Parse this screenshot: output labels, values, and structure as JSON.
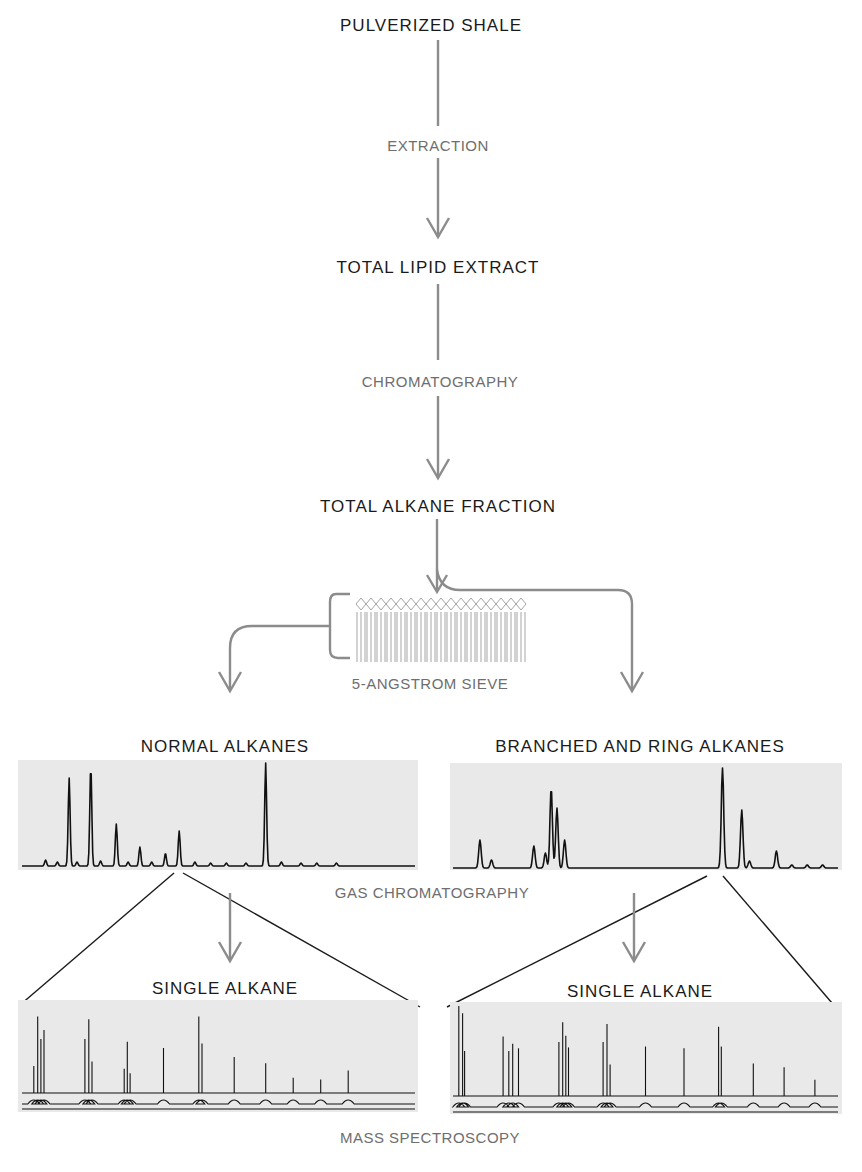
{
  "nodes": {
    "pulverized_shale": "PULVERIZED SHALE",
    "total_lipid_extract": "TOTAL LIPID EXTRACT",
    "total_alkane_fraction": "TOTAL ALKANE FRACTION",
    "normal_alkanes": "NORMAL ALKANES",
    "branched_ring_alkanes": "BRANCHED AND RING ALKANES",
    "single_alkane_left": "SINGLE ALKANE",
    "single_alkane_right": "SINGLE ALKANE"
  },
  "steps": {
    "extraction": "EXTRACTION",
    "chromatography": "CHROMATOGRAPHY",
    "sieve": "5-ANGSTROM SIEVE",
    "gas_chromatography": "GAS CHROMATOGRAPHY",
    "mass_spectroscopy": "MASS SPECTROSCOPY"
  },
  "traces": {
    "normal_gc_peaks": [
      [
        0.06,
        0.06
      ],
      [
        0.09,
        0.04
      ],
      [
        0.12,
        0.88
      ],
      [
        0.14,
        0.04
      ],
      [
        0.175,
        1.0
      ],
      [
        0.2,
        0.05
      ],
      [
        0.24,
        0.42
      ],
      [
        0.27,
        0.04
      ],
      [
        0.3,
        0.19
      ],
      [
        0.33,
        0.04
      ],
      [
        0.365,
        0.13
      ],
      [
        0.4,
        0.35
      ],
      [
        0.44,
        0.04
      ],
      [
        0.48,
        0.03
      ],
      [
        0.52,
        0.03
      ],
      [
        0.57,
        0.03
      ],
      [
        0.62,
        1.03
      ],
      [
        0.66,
        0.04
      ],
      [
        0.71,
        0.03
      ],
      [
        0.75,
        0.03
      ],
      [
        0.8,
        0.03
      ]
    ],
    "branched_gc_peaks": [
      [
        0.07,
        0.28
      ],
      [
        0.1,
        0.08
      ],
      [
        0.21,
        0.22
      ],
      [
        0.24,
        0.15
      ],
      [
        0.255,
        0.8
      ],
      [
        0.27,
        0.6
      ],
      [
        0.29,
        0.28
      ],
      [
        0.7,
        1.0
      ],
      [
        0.75,
        0.58
      ],
      [
        0.77,
        0.07
      ],
      [
        0.84,
        0.17
      ],
      [
        0.88,
        0.03
      ],
      [
        0.92,
        0.03
      ],
      [
        0.96,
        0.03
      ]
    ],
    "ms_left_peaks": [
      [
        0.03,
        0.3
      ],
      [
        0.04,
        0.85
      ],
      [
        0.048,
        0.6
      ],
      [
        0.056,
        0.7
      ],
      [
        0.16,
        0.6
      ],
      [
        0.17,
        0.82
      ],
      [
        0.178,
        0.35
      ],
      [
        0.26,
        0.27
      ],
      [
        0.268,
        0.57
      ],
      [
        0.275,
        0.22
      ],
      [
        0.36,
        0.5
      ],
      [
        0.45,
        0.85
      ],
      [
        0.458,
        0.55
      ],
      [
        0.54,
        0.4
      ],
      [
        0.62,
        0.33
      ],
      [
        0.69,
        0.17
      ],
      [
        0.76,
        0.15
      ],
      [
        0.83,
        0.25
      ]
    ],
    "ms_right_peaks": [
      [
        0.015,
        1.0
      ],
      [
        0.025,
        0.92
      ],
      [
        0.03,
        0.5
      ],
      [
        0.13,
        0.66
      ],
      [
        0.145,
        0.5
      ],
      [
        0.155,
        0.58
      ],
      [
        0.17,
        0.53
      ],
      [
        0.275,
        0.6
      ],
      [
        0.285,
        0.82
      ],
      [
        0.293,
        0.67
      ],
      [
        0.3,
        0.54
      ],
      [
        0.39,
        0.6
      ],
      [
        0.4,
        0.8
      ],
      [
        0.408,
        0.35
      ],
      [
        0.5,
        0.55
      ],
      [
        0.6,
        0.53
      ],
      [
        0.69,
        0.77
      ],
      [
        0.697,
        0.55
      ],
      [
        0.78,
        0.36
      ],
      [
        0.86,
        0.32
      ],
      [
        0.94,
        0.18
      ]
    ]
  }
}
